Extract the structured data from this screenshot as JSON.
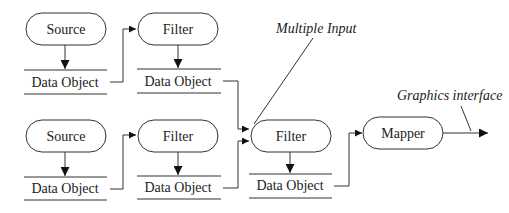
{
  "diagram": {
    "type": "visualization pipeline",
    "nodes": [
      {
        "id": "source1",
        "label": "Source",
        "kind": "process"
      },
      {
        "id": "data1",
        "label": "Data Object",
        "kind": "data"
      },
      {
        "id": "filter1",
        "label": "Filter",
        "kind": "process"
      },
      {
        "id": "data2",
        "label": "Data Object",
        "kind": "data"
      },
      {
        "id": "source2",
        "label": "Source",
        "kind": "process"
      },
      {
        "id": "data3",
        "label": "Data Object",
        "kind": "data"
      },
      {
        "id": "filter2",
        "label": "Filter",
        "kind": "process"
      },
      {
        "id": "data4",
        "label": "Data Object",
        "kind": "data"
      },
      {
        "id": "filter3",
        "label": "Filter",
        "kind": "process"
      },
      {
        "id": "data5",
        "label": "Data Object",
        "kind": "data"
      },
      {
        "id": "mapper",
        "label": "Mapper",
        "kind": "process"
      }
    ],
    "edges": [
      {
        "from": "source1",
        "to": "data1"
      },
      {
        "from": "data1",
        "to": "filter1"
      },
      {
        "from": "filter1",
        "to": "data2"
      },
      {
        "from": "data2",
        "to": "filter3"
      },
      {
        "from": "source2",
        "to": "data3"
      },
      {
        "from": "data3",
        "to": "filter2"
      },
      {
        "from": "filter2",
        "to": "data4"
      },
      {
        "from": "data4",
        "to": "filter3"
      },
      {
        "from": "filter3",
        "to": "data5"
      },
      {
        "from": "data5",
        "to": "mapper"
      },
      {
        "from": "mapper",
        "to": "output"
      }
    ],
    "annotations": {
      "multiple_input": "Multiple Input",
      "graphics_interface": "Graphics interface"
    }
  }
}
